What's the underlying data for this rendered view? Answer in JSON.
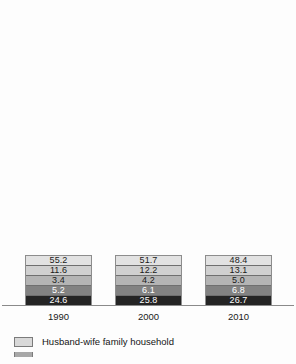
{
  "chart_data": {
    "type": "bar",
    "subtype": "stacked-100-percent",
    "title": "",
    "xlabel": "",
    "ylabel": "",
    "ylim": [
      0,
      100
    ],
    "grid": false,
    "legend_position": "bottom-left",
    "categories": [
      "1990",
      "2000",
      "2010"
    ],
    "series": [
      {
        "name": "Husband-wife family household",
        "color": "#e2e2e2",
        "values": [
          55.2,
          51.7,
          48.4
        ],
        "stack_order": 5
      },
      {
        "name": "series-2",
        "color": "#d0d0d0",
        "values": [
          11.6,
          12.2,
          13.1
        ],
        "stack_order": 4
      },
      {
        "name": "series-3",
        "color": "#b4b4b4",
        "values": [
          3.4,
          4.2,
          5.0
        ],
        "stack_order": 3
      },
      {
        "name": "series-4",
        "color": "#828282",
        "values": [
          5.2,
          6.1,
          6.8
        ],
        "stack_order": 2
      },
      {
        "name": "series-5",
        "color": "#242424",
        "values": [
          24.6,
          25.8,
          26.7
        ],
        "stack_order": 1
      }
    ],
    "bars": [
      {
        "category": "1990",
        "segments": [
          {
            "value": 55.2,
            "label": "55.2",
            "color": "#e2e2e2",
            "text_color": "#1a1a1a"
          },
          {
            "value": 11.6,
            "label": "11.6",
            "color": "#d0d0d0",
            "text_color": "#1a1a1a"
          },
          {
            "value": 3.4,
            "label": "3.4",
            "color": "#b4b4b4",
            "text_color": "#1a1a1a"
          },
          {
            "value": 5.2,
            "label": "5.2",
            "color": "#828282",
            "text_color": "#ffffff"
          },
          {
            "value": 24.6,
            "label": "24.6",
            "color": "#242424",
            "text_color": "#ffffff"
          }
        ]
      },
      {
        "category": "2000",
        "segments": [
          {
            "value": 51.7,
            "label": "51.7",
            "color": "#e2e2e2",
            "text_color": "#1a1a1a"
          },
          {
            "value": 12.2,
            "label": "12.2",
            "color": "#d0d0d0",
            "text_color": "#1a1a1a"
          },
          {
            "value": 4.2,
            "label": "4.2",
            "color": "#b4b4b4",
            "text_color": "#1a1a1a"
          },
          {
            "value": 6.1,
            "label": "6.1",
            "color": "#828282",
            "text_color": "#ffffff"
          },
          {
            "value": 25.8,
            "label": "25.8",
            "color": "#242424",
            "text_color": "#ffffff"
          }
        ]
      },
      {
        "category": "2010",
        "segments": [
          {
            "value": 48.4,
            "label": "48.4",
            "color": "#e2e2e2",
            "text_color": "#1a1a1a"
          },
          {
            "value": 13.1,
            "label": "13.1",
            "color": "#d0d0d0",
            "text_color": "#1a1a1a"
          },
          {
            "value": 5.0,
            "label": "5.0",
            "color": "#b4b4b4",
            "text_color": "#1a1a1a"
          },
          {
            "value": 6.8,
            "label": "6.8",
            "color": "#828282",
            "text_color": "#ffffff"
          },
          {
            "value": 26.7,
            "label": "26.7",
            "color": "#242424",
            "text_color": "#ffffff"
          }
        ]
      }
    ],
    "legend": [
      {
        "label": "Husband-wife family household",
        "color": "#d9d9d9",
        "clipped": false
      },
      {
        "label": "",
        "color": "#a8a8a8",
        "clipped": true
      }
    ]
  }
}
